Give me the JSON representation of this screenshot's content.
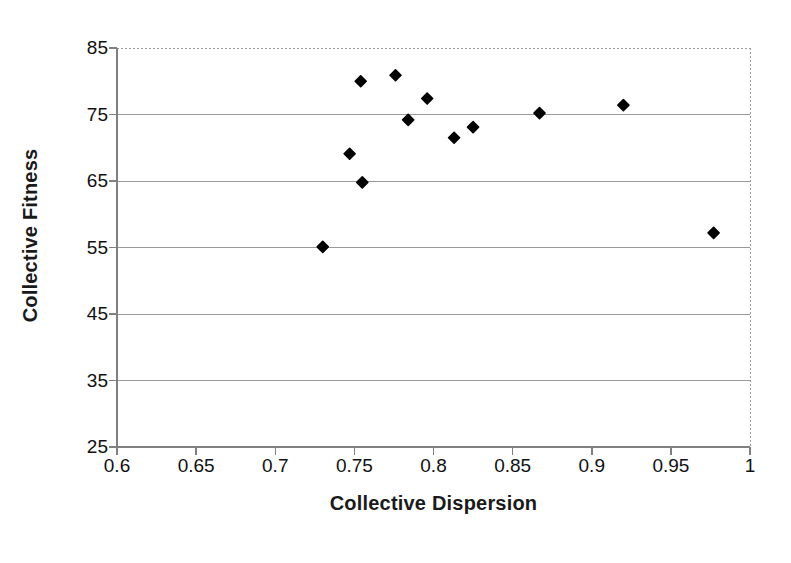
{
  "chart_data": {
    "type": "scatter",
    "title": "",
    "xlabel": "Collective Dispersion",
    "ylabel": "Collective Fitness",
    "xlim": [
      0.6,
      1.0
    ],
    "ylim": [
      25,
      85
    ],
    "xticks": [
      "0.6",
      "0.65",
      "0.7",
      "0.75",
      "0.8",
      "0.85",
      "0.9",
      "0.95",
      "1"
    ],
    "xtick_values": [
      0.6,
      0.65,
      0.7,
      0.75,
      0.8,
      0.85,
      0.9,
      0.95,
      1.0
    ],
    "yticks": [
      "25",
      "35",
      "45",
      "55",
      "65",
      "75",
      "85"
    ],
    "ytick_values": [
      25,
      35,
      45,
      55,
      65,
      75,
      85
    ],
    "grid": "horizontal",
    "legend": "none",
    "marker": "diamond",
    "marker_color": "#000000",
    "marker_size": 11,
    "series": [
      {
        "name": "Collective Fitness vs Collective Dispersion",
        "points": [
          {
            "x": 0.73,
            "y": 55.1
          },
          {
            "x": 0.747,
            "y": 69.1
          },
          {
            "x": 0.754,
            "y": 80.0
          },
          {
            "x": 0.755,
            "y": 64.8
          },
          {
            "x": 0.776,
            "y": 80.9
          },
          {
            "x": 0.784,
            "y": 74.2
          },
          {
            "x": 0.796,
            "y": 77.4
          },
          {
            "x": 0.813,
            "y": 71.5
          },
          {
            "x": 0.825,
            "y": 73.1
          },
          {
            "x": 0.867,
            "y": 75.2
          },
          {
            "x": 0.92,
            "y": 76.4
          },
          {
            "x": 0.977,
            "y": 57.2
          }
        ]
      }
    ]
  },
  "style": {
    "axis_color": "#808080",
    "grid_color": "#9a9a9a",
    "background": "#ffffff",
    "text_color": "#111111"
  }
}
